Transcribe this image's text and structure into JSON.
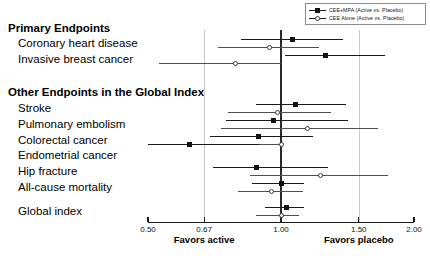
{
  "chart_data": {
    "type": "scatter",
    "subtype": "forest-plot",
    "title": "",
    "xlabel": "Hazard Ratio",
    "ylabel": "",
    "xscale": "log",
    "xlim": [
      0.5,
      2.0
    ],
    "grid": true,
    "gridlines_at": [
      0.67,
      1.5
    ],
    "reference_line": 1.0,
    "xticks": [
      "0.50",
      "0.67",
      "1.00",
      "1.50",
      "2.00"
    ],
    "xtick_values": [
      0.5,
      0.67,
      1.0,
      1.5,
      2.0
    ],
    "axis_annotations": {
      "left": "Favors active",
      "right": "Favors placebo"
    },
    "legend_position": "top-right",
    "series": [
      {
        "name": "CEE+MPA (Active vs. Placebo)",
        "marker": "filled-square",
        "color": "#111111"
      },
      {
        "name": "CEE Alone (Active vs. Placebo)",
        "marker": "open-circle",
        "color": "#3c3c3c"
      }
    ],
    "sections": [
      {
        "heading": "Primary Endpoints",
        "endpoints": [
          {
            "label": "Coronary heart disease",
            "cee_mpa": {
              "hr": 1.06,
              "lo": 0.81,
              "hi": 1.38
            },
            "cee_alone": {
              "hr": 0.94,
              "lo": 0.72,
              "hi": 1.22
            }
          },
          {
            "label": "Invasive breast cancer",
            "cee_mpa": {
              "hr": 1.26,
              "lo": 1.02,
              "hi": 1.72
            },
            "cee_alone": {
              "hr": 0.79,
              "lo": 0.53,
              "hi": 1.0
            }
          }
        ]
      },
      {
        "heading": "Other Endpoints in the Global Index",
        "endpoints": [
          {
            "label": "Stroke",
            "cee_mpa": {
              "hr": 1.08,
              "lo": 0.88,
              "hi": 1.4
            },
            "cee_alone": {
              "hr": 0.98,
              "lo": 0.76,
              "hi": 1.3
            }
          },
          {
            "label": "Pulmonary embolism",
            "cee_mpa": {
              "hr": 0.96,
              "lo": 0.75,
              "hi": 1.42
            },
            "cee_alone": {
              "hr": 1.15,
              "lo": 0.73,
              "hi": 1.66
            }
          },
          {
            "label": "Colorectal cancer",
            "cee_mpa": {
              "hr": 0.89,
              "lo": 0.69,
              "hi": 1.18
            },
            "cee_alone": {
              "hr": 1.0,
              "lo": 0.78,
              "hi": 1.0
            }
          },
          {
            "label": "Endometrial cancer",
            "cee_mpa": {
              "hr": 0.62,
              "lo": 0.5,
              "hi": 0.89
            },
            "cee_alone": null
          },
          {
            "label": "Hip fracture",
            "cee_mpa": {
              "hr": 0.88,
              "lo": 0.7,
              "hi": 1.28
            },
            "cee_alone": {
              "hr": 1.23,
              "lo": 0.85,
              "hi": 1.75
            }
          },
          {
            "label": "All-cause mortality",
            "cee_mpa": {
              "hr": 1.0,
              "lo": 0.86,
              "hi": 1.13
            },
            "cee_alone": {
              "hr": 0.95,
              "lo": 0.8,
              "hi": 1.12
            }
          }
        ]
      },
      {
        "heading": "",
        "endpoints": [
          {
            "label": "Global index",
            "cee_mpa": {
              "hr": 1.03,
              "lo": 0.92,
              "hi": 1.13
            },
            "cee_alone": {
              "hr": 1.0,
              "lo": 0.88,
              "hi": 1.1
            }
          }
        ]
      }
    ]
  },
  "legend": {
    "items": [
      {
        "label": "CEE+MPA (Active vs. Placebo)",
        "marker": "filled-square"
      },
      {
        "label": "CEE Alone (Active vs. Placebo)",
        "marker": "open-circle"
      }
    ]
  },
  "labels": {
    "primary_heading": "Primary Endpoints",
    "coronary_heart_disease": "Coronary heart disease",
    "invasive_breast_cancer": "Invasive breast cancer",
    "other_heading": "Other Endpoints in the Global Index",
    "stroke": "Stroke",
    "pulmonary_embolism": "Pulmonary embolism",
    "colorectal_cancer": "Colorectal cancer",
    "endometrial_cancer": "Endometrial cancer",
    "hip_fracture": "Hip fracture",
    "all_cause_mortality": "All-cause mortality",
    "global_index": "Global index"
  },
  "axis": {
    "favors_active": "Favors active",
    "favors_placebo": "Favors placebo",
    "tick_050": "0.50",
    "tick_067": "0.67",
    "tick_100": "1.00",
    "tick_150": "1.50",
    "tick_200": "2.00"
  }
}
